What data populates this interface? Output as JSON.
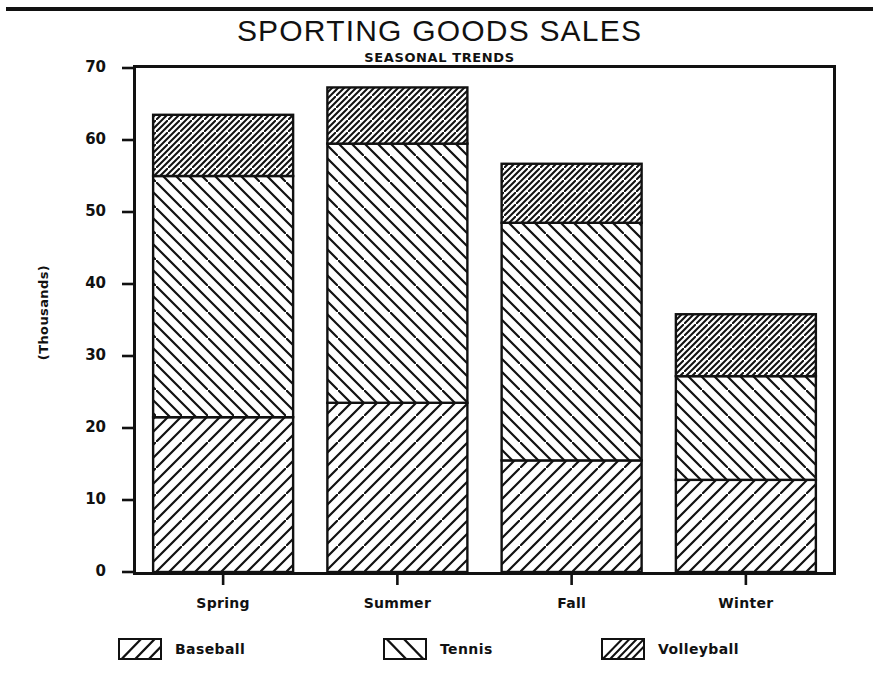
{
  "chart_data": {
    "type": "bar",
    "subtype": "stacked-bar",
    "title": "SPORTING GOODS SALES",
    "subtitle": "SEASONAL TRENDS",
    "xlabel": "",
    "ylabel": "(Thousands)",
    "categories": [
      "Spring",
      "Summer",
      "Fall",
      "Winter"
    ],
    "series": [
      {
        "name": "Baseball",
        "pattern": "diagonal-forward",
        "values": [
          21.5,
          23.5,
          15.5,
          12.8
        ]
      },
      {
        "name": "Tennis",
        "pattern": "diagonal-backward",
        "values": [
          33.5,
          36.0,
          33.0,
          14.4
        ]
      },
      {
        "name": "Volleyball",
        "pattern": "diagonal-forward-dense",
        "values": [
          8.5,
          7.8,
          8.2,
          8.6
        ]
      }
    ],
    "stack_totals": [
      63.5,
      67.3,
      56.7,
      35.8
    ],
    "ylim": [
      0,
      70
    ],
    "yticks": [
      0,
      10,
      20,
      30,
      40,
      50,
      60,
      70
    ],
    "ytick_labels": [
      "0",
      "10",
      "20",
      "30",
      "40",
      "50",
      "60",
      "70"
    ],
    "grid": false,
    "legend_position": "bottom",
    "frame": true,
    "colors": {
      "ink": "#111111",
      "background": "#ffffff",
      "fill": "#ffffff"
    }
  },
  "legend": {
    "items": [
      {
        "label": "Baseball"
      },
      {
        "label": "Tennis"
      },
      {
        "label": "Volleyball"
      }
    ]
  }
}
